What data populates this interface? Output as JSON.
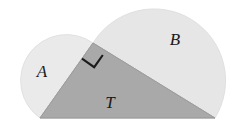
{
  "figure": {
    "background_color": "#ffffff",
    "width": 237,
    "height": 138
  },
  "labels": {
    "semicircle_a": "A",
    "semicircle_b": "B",
    "triangle": "T"
  },
  "label_positions": {
    "semicircle_a": {
      "x": 42,
      "y": 73
    },
    "semicircle_b": {
      "x": 175,
      "y": 41
    },
    "triangle": {
      "x": 110,
      "y": 104
    }
  },
  "colors": {
    "semicircle_a_fill": "#eaeaea",
    "semicircle_b_fill": "#e6e6e6",
    "triangle_fill": "#a9a9a9",
    "overlap_a_triangle": "#bdbdbd",
    "overlap_b_triangle": "#c4c4c4",
    "outline": "#d2d2d2",
    "mark_stroke": "#1c1c1c",
    "label_text": "#1a1a1a"
  },
  "geometry": {
    "triangle_vertices": [
      {
        "name": "right-angle-apex",
        "x": 93,
        "y": 43
      },
      {
        "name": "base-left",
        "x": 40,
        "y": 118
      },
      {
        "name": "base-right",
        "x": 215,
        "y": 118
      }
    ],
    "semicircle_a": {
      "diameter_endpoints": [
        {
          "x": 40,
          "y": 118
        },
        {
          "x": 93,
          "y": 43
        }
      ],
      "center": {
        "x": 66.5,
        "y": 80.5
      },
      "radius": 45.9,
      "bulge": "up-left"
    },
    "semicircle_b": {
      "diameter_endpoints": [
        {
          "x": 93,
          "y": 43
        },
        {
          "x": 215,
          "y": 118
        }
      ],
      "center": {
        "x": 154,
        "y": 80.5
      },
      "radius": 71.6,
      "bulge": "up-right"
    },
    "right_angle_marker": {
      "vertex": {
        "x": 93,
        "y": 43
      },
      "size": 17
    }
  }
}
